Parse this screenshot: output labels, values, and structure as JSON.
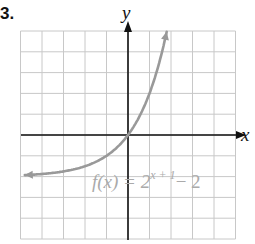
{
  "problem_number": "3.",
  "chart_data": {
    "type": "line",
    "title": "",
    "function_label": "f(x) = 2^(x+1) − 2",
    "function_parts": {
      "lhs": "f(x) = 2",
      "exponent": "x + 1",
      "rhs": "− 2"
    },
    "xlabel": "x",
    "ylabel": "y",
    "xlim": [
      -5,
      5
    ],
    "ylim": [
      -5,
      5
    ],
    "grid": true,
    "grid_step": 1,
    "tick_labels": false,
    "asymptote": {
      "y": -2,
      "drawn": false
    },
    "series": [
      {
        "name": "f(x) = 2^(x+1) - 2",
        "color": "#999999",
        "x": [
          -4.8,
          -4,
          -3,
          -2,
          -1,
          0,
          0.5,
          1,
          1.5,
          1.8
        ],
        "y": [
          -1.96,
          -1.875,
          -1.75,
          -1.5,
          -1,
          0,
          0.83,
          2,
          3.66,
          4.96
        ],
        "left_arrow": true,
        "right_arrow": true
      }
    ]
  },
  "colors": {
    "grid": "#c8c8c8",
    "axis": "#111111",
    "curve": "#999999",
    "label": "#aaaaaa"
  }
}
